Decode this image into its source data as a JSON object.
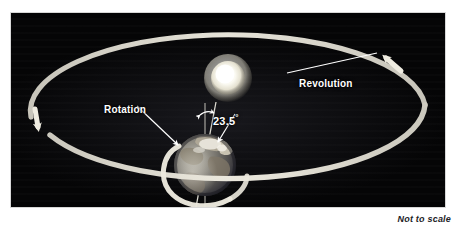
{
  "figure": {
    "title_caption": "Not to scale",
    "panel": {
      "background_color": "#050506",
      "border_color": "#d8d8d8"
    },
    "labels": {
      "revolution": "Revolution",
      "rotation": "Rotation",
      "axial_tilt_value": "23.5",
      "axial_tilt_degree_symbol": "°",
      "axial_tilt_full": "23.5°"
    },
    "colors": {
      "orbit_path": "#dfdcd2",
      "leader_line": "#ffffff",
      "label_text": "#ffffff",
      "caption_text": "#222226",
      "sun_core": "#ffffff",
      "sun_glow": "#f2efe2",
      "earth_ocean": "#4b5a6b",
      "earth_land": "#8d8475",
      "earth_cloud": "#e8e8e4"
    },
    "objects": [
      {
        "name": "sun",
        "kind": "star",
        "cx": 228,
        "cy": 78,
        "r": 17
      },
      {
        "name": "earth",
        "kind": "planet",
        "cx": 205,
        "cy": 165,
        "r": 31
      },
      {
        "name": "orbit-ellipse",
        "kind": "path",
        "cx": 228,
        "cy": 113,
        "rx": 197,
        "ry": 76
      }
    ],
    "annotations": [
      {
        "name": "revolution-leader",
        "from": [
          286,
          72
        ],
        "to": [
          376,
          52
        ]
      },
      {
        "name": "rotation-leader",
        "from": [
          136,
          104
        ],
        "to": [
          176,
          143
        ]
      },
      {
        "name": "tilt-leader",
        "from": [
          233,
          112
        ],
        "to": [
          216,
          140
        ]
      },
      {
        "name": "tilt-vertical-reference",
        "from": [
          205,
          103
        ],
        "to": [
          205,
          207
        ]
      },
      {
        "name": "tilt-axis",
        "from": [
          215,
          103
        ],
        "to": [
          196,
          207
        ]
      }
    ]
  }
}
